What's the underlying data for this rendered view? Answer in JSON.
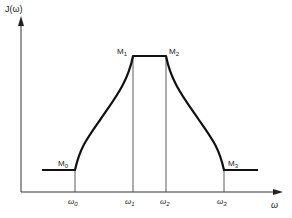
{
  "diagram": {
    "y_axis_label": "J(ω)",
    "x_axis_label": "ω",
    "points": [
      {
        "name": "M",
        "sub": "0"
      },
      {
        "name": "M",
        "sub": "1"
      },
      {
        "name": "M",
        "sub": "2"
      },
      {
        "name": "M",
        "sub": "3"
      }
    ],
    "ticks": [
      {
        "name": "ω",
        "sub": "0"
      },
      {
        "name": "ω",
        "sub": "1"
      },
      {
        "name": "ω",
        "sub": "2"
      },
      {
        "name": "ω",
        "sub": "3"
      }
    ],
    "colors": {
      "line": "#1a1a1a",
      "background": "#ffffff"
    }
  }
}
